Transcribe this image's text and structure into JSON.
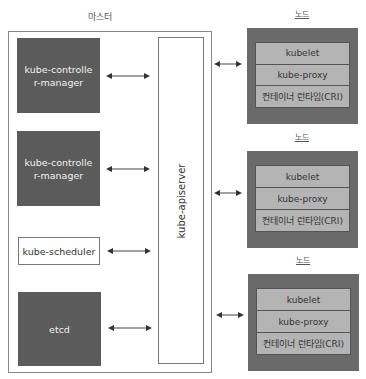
{
  "master": {
    "title": "마스터",
    "components": [
      {
        "label": "kube-controller-manager",
        "style": "dark"
      },
      {
        "label": "kube-controller-manager",
        "style": "dark"
      },
      {
        "label": "kube-scheduler",
        "style": "light"
      },
      {
        "label": "etcd",
        "style": "dark"
      }
    ],
    "apiserver": {
      "label": "kube-apiserver"
    }
  },
  "nodes": [
    {
      "title": "노드",
      "rows": [
        "kubelet",
        "kube-proxy",
        "컨테이너 런타임(CRI)"
      ]
    },
    {
      "title": "노드",
      "rows": [
        "kubelet",
        "kube-proxy",
        "컨테이너 런타임(CRI)"
      ]
    },
    {
      "title": "노드",
      "rows": [
        "kubelet",
        "kube-proxy",
        "컨테이너 런타임(CRI)"
      ]
    }
  ],
  "colors": {
    "dark_box": "#5b5b5b",
    "node_outer": "#6a6a6a",
    "node_inner": "#b4b4b4",
    "arrow": "#444444"
  }
}
